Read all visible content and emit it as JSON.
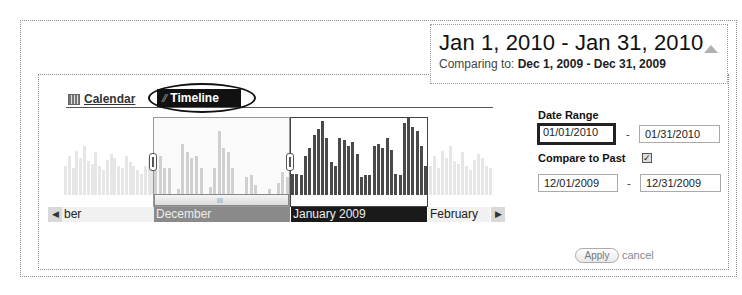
{
  "summary": {
    "range": "Jan 1, 2010 - Jan 31, 2010",
    "compare_prefix": "Comparing to: ",
    "compare_range": "Dec 1, 2009 - Dec 31, 2009"
  },
  "tabs": [
    {
      "label": "Calendar",
      "icon": "calendar-icon",
      "active": false
    },
    {
      "label": "Timeline",
      "icon": "line-chart-icon",
      "active": true
    }
  ],
  "timeline": {
    "months": [
      {
        "label": "ber",
        "state": "partial"
      },
      {
        "label": "December",
        "state": "comparison"
      },
      {
        "label": "January 2009",
        "state": "selected"
      },
      {
        "label": "February",
        "state": "normal"
      }
    ],
    "scroll_grip": "III",
    "prev_arrow": "◀",
    "next_arrow": "▶"
  },
  "chart_data": {
    "type": "bar",
    "title": "",
    "series": [
      {
        "name": "Background (faded)",
        "values": [
          30,
          40,
          28,
          45,
          38,
          50,
          35,
          32,
          44,
          30,
          26,
          36,
          42,
          38,
          30,
          28,
          40,
          34,
          30,
          26,
          22,
          30,
          38,
          32
        ]
      },
      {
        "name": "December (comparison)",
        "values": [
          38,
          40,
          28,
          28,
          0,
          6,
          52,
          44,
          38,
          40,
          28,
          0,
          8,
          28,
          66,
          48,
          44,
          28,
          0,
          0,
          18,
          20,
          10,
          0,
          0,
          6,
          0,
          12,
          24,
          18
        ]
      },
      {
        "name": "January (selected)",
        "values": [
          22,
          22,
          20,
          40,
          48,
          62,
          68,
          76,
          58,
          34,
          30,
          58,
          56,
          50,
          54,
          42,
          18,
          20,
          20,
          50,
          52,
          48,
          58,
          46,
          22,
          20,
          74,
          80,
          70,
          66,
          50,
          30
        ]
      }
    ],
    "categories_months": [
      "November",
      "December",
      "January 2009",
      "February"
    ],
    "ylim": [
      0,
      80
    ]
  },
  "form": {
    "date_range_label": "Date Range",
    "start_date": "01/01/2010",
    "end_date": "01/31/2010",
    "compare_label": "Compare to Past",
    "compare_checked": true,
    "compare_start": "12/01/2009",
    "compare_end": "12/31/2009",
    "dash": "-",
    "apply_label": "Apply",
    "cancel_label": "cancel"
  }
}
